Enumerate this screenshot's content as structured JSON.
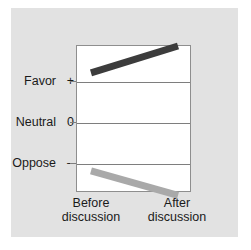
{
  "chart_data": {
    "type": "line",
    "title": "",
    "subtitle": "",
    "xlabel": "",
    "ylabel": "",
    "categories": [
      "Before discussion",
      "After discussion"
    ],
    "x": [
      0,
      1
    ],
    "y_tick_labels": [
      "Favor",
      "Neutral",
      "Oppose"
    ],
    "y_tick_signs": [
      "+",
      "0",
      "–"
    ],
    "y_tick_values": [
      1,
      0,
      -1
    ],
    "ylim": [
      -1.45,
      1.55
    ],
    "grid": true,
    "legend": "none",
    "series": [
      {
        "name": "pro-attitude group",
        "color": "#3c3c3c",
        "values": [
          1.0,
          1.55
        ],
        "points": [
          {
            "x": 0,
            "y": 1.0
          },
          {
            "x": 1,
            "y": 1.55
          }
        ]
      },
      {
        "name": "anti-attitude group",
        "color": "#a9a9a9",
        "values": [
          -1.0,
          -1.5
        ],
        "points": [
          {
            "x": 0,
            "y": -1.0
          },
          {
            "x": 1,
            "y": -1.5
          }
        ]
      }
    ],
    "annotations": []
  },
  "axes": {
    "y_labels": [
      {
        "text": "Favor",
        "sign": "+"
      },
      {
        "text": "Neutral",
        "sign": "0"
      },
      {
        "text": "Oppose",
        "sign": "–"
      }
    ],
    "x_labels": [
      {
        "line1": "Before",
        "line2": "discussion"
      },
      {
        "line1": "After",
        "line2": "discussion"
      }
    ]
  },
  "colors": {
    "panel_background": "#e2e2e2",
    "plot_background": "#ffffff",
    "axis_line": "#8e8e8e",
    "gridline": "#7e7e7e",
    "series_dark": "#3c3c3c",
    "series_light": "#a9a9a9",
    "text": "#1a1a1a"
  }
}
